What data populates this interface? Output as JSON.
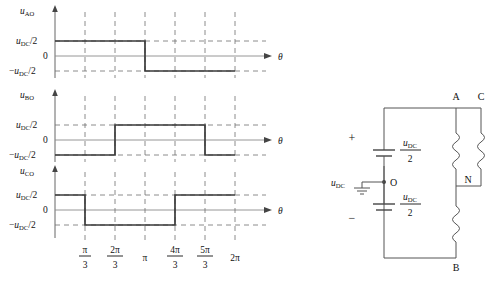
{
  "figure": {
    "theta_symbol": "θ",
    "levels": {
      "pos_label_main": "u",
      "pos_label_sub": "DC",
      "pos_label_tail": "/2",
      "zero_label": "0",
      "neg_label_sign": "−",
      "neg_label_main": "u",
      "neg_label_sub": "DC",
      "neg_label_tail": "/2"
    },
    "waveforms": [
      {
        "name": "u_AO",
        "label_main": "u",
        "label_sub": "AO",
        "axis_label": "θ",
        "segments": [
          {
            "from": 0.0,
            "to": 3.141592653589793,
            "level": 1
          },
          {
            "from": 3.141592653589793,
            "to": 6.283185307179586,
            "level": -1
          }
        ]
      },
      {
        "name": "u_BO",
        "label_main": "u",
        "label_sub": "BO",
        "axis_label": "θ",
        "segments": [
          {
            "from": 0.0,
            "to": 2.0943951023931953,
            "level": -1
          },
          {
            "from": 2.0943951023931953,
            "to": 5.235987755982989,
            "level": 1
          },
          {
            "from": 5.235987755982989,
            "to": 6.283185307179586,
            "level": -1
          }
        ]
      },
      {
        "name": "u_CO",
        "label_main": "u",
        "label_sub": "CO",
        "axis_label": "θ",
        "segments": [
          {
            "from": 0.0,
            "to": 1.0471975511965976,
            "level": 1
          },
          {
            "from": 1.0471975511965976,
            "to": 4.1887902047863905,
            "level": -1
          },
          {
            "from": 4.1887902047863905,
            "to": 6.283185307179586,
            "level": 1
          }
        ]
      }
    ],
    "xticks": [
      {
        "value": 1.0471975511965976,
        "num": "π",
        "den": "3",
        "is_fraction": true
      },
      {
        "value": 2.0943951023931953,
        "num": "2π",
        "den": "3",
        "is_fraction": true
      },
      {
        "value": 3.141592653589793,
        "num": "π",
        "den": "",
        "is_fraction": false
      },
      {
        "value": 4.1887902047863905,
        "num": "4π",
        "den": "3",
        "is_fraction": true
      },
      {
        "value": 5.235987755982989,
        "num": "5π",
        "den": "3",
        "is_fraction": true
      },
      {
        "value": 6.283185307179586,
        "num": "2π",
        "den": "",
        "is_fraction": false
      }
    ],
    "circuit": {
      "plus_sign": "+",
      "minus_sign": "−",
      "source_label_main": "u",
      "source_label_sub": "DC",
      "cap_label_main": "u",
      "cap_label_sub": "DC",
      "cap_label_den": "2",
      "node_O": "O",
      "node_A": "A",
      "node_B": "B",
      "node_C": "C",
      "node_N": "N"
    }
  },
  "colors": {
    "wave": "#3a3a3a",
    "axis": "#555555",
    "grid": "#6f6f6f",
    "zero": "#8a8a8a",
    "text": "#111111",
    "background": "#ffffff"
  }
}
